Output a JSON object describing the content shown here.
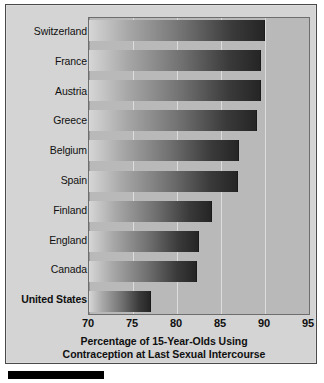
{
  "chart_data": {
    "type": "bar",
    "orientation": "horizontal",
    "title": "",
    "xlabel": "Percentage of 15-Year-Olds Using Contraception at Last Sexual Intercourse",
    "ylabel": "",
    "xlim": [
      70,
      95
    ],
    "xticks": [
      70,
      75,
      80,
      85,
      90,
      95
    ],
    "grid": true,
    "legend": "none",
    "categories": [
      "Switzerland",
      "France",
      "Austria",
      "Greece",
      "Belgium",
      "Spain",
      "Finland",
      "England",
      "Canada",
      "United States"
    ],
    "values": [
      90.0,
      89.6,
      89.5,
      89.1,
      87.0,
      86.9,
      84.0,
      82.5,
      82.3,
      77.0
    ],
    "highlight_category": "United States"
  },
  "axis": {
    "title_line1": "Percentage of 15-Year-Olds Using",
    "title_line2": "Contraception at Last Sexual Intercourse",
    "tick_labels": [
      "70",
      "75",
      "80",
      "85",
      "90",
      "95"
    ]
  },
  "colors": {
    "panel_background": "#d4d4d4",
    "plot_background": "#b9b9b9",
    "gridline": "#e2e2e2",
    "bar_light": "#d6d6d6",
    "bar_dark": "#252525",
    "text": "#101010",
    "frame": "#4a4a4a",
    "rule": "#000000"
  }
}
